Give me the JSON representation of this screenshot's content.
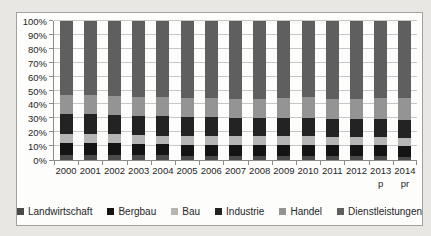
{
  "chart_data": {
    "type": "bar",
    "subtype": "stacked-100-percent",
    "title": "",
    "xlabel": "",
    "ylabel": "",
    "ylim": [
      0,
      100
    ],
    "grid": true,
    "legend_position": "bottom",
    "y_tick_labels": [
      "0%",
      "10%",
      "20%",
      "30%",
      "40%",
      "50%",
      "60%",
      "70%",
      "80%",
      "90%",
      "100%"
    ],
    "categories": [
      "2000",
      "2001",
      "2002",
      "2003",
      "2004",
      "2005",
      "2006",
      "2007",
      "2008",
      "2009",
      "2010",
      "2011",
      "2012",
      "2013",
      "2014"
    ],
    "category_sub_labels": [
      "",
      "",
      "",
      "",
      "",
      "",
      "",
      "",
      "",
      "",
      "",
      "",
      "",
      "p",
      "pr"
    ],
    "series": [
      {
        "name": "Landwirtschaft",
        "color": "#4a4a4a",
        "values": [
          3.5,
          3.5,
          3.5,
          3.5,
          3.5,
          3,
          3,
          3,
          3,
          3,
          3,
          3,
          3,
          3,
          2.5
        ]
      },
      {
        "name": "Bergbau",
        "color": "#141414",
        "values": [
          8.5,
          8.5,
          8.5,
          8,
          8,
          8,
          8,
          8,
          8,
          8,
          8,
          7.5,
          7.5,
          7.5,
          7.5
        ]
      },
      {
        "name": "Bau",
        "color": "#b5b5b5",
        "values": [
          6.5,
          6.5,
          6.5,
          6.5,
          6,
          6,
          6,
          6,
          6,
          6,
          6,
          6,
          6,
          6,
          6
        ]
      },
      {
        "name": "Industrie",
        "color": "#232323",
        "values": [
          14.5,
          14.5,
          14,
          14,
          14,
          14,
          14,
          13.5,
          13.5,
          13.5,
          13,
          13,
          13,
          13,
          13
        ]
      },
      {
        "name": "Handel",
        "color": "#949494",
        "values": [
          14,
          13.5,
          13.5,
          13.5,
          13.5,
          13.5,
          13.5,
          13.5,
          13.5,
          14,
          15,
          14.5,
          14.5,
          15,
          15.5
        ]
      },
      {
        "name": "Dienstleistungen",
        "color": "#5f5f5f",
        "values": [
          53,
          53.5,
          54,
          54.5,
          55,
          55.5,
          55.5,
          56,
          56,
          55.5,
          55,
          56,
          56,
          55.5,
          55.5
        ]
      }
    ]
  },
  "frame": {
    "background": "#fdfdfc",
    "border_color": "#a3a19e",
    "page_background": "#e9e7e4",
    "gridline_color": "#c7c7c7",
    "axis_color": "#8c8c8c",
    "text_color": "#262626"
  }
}
